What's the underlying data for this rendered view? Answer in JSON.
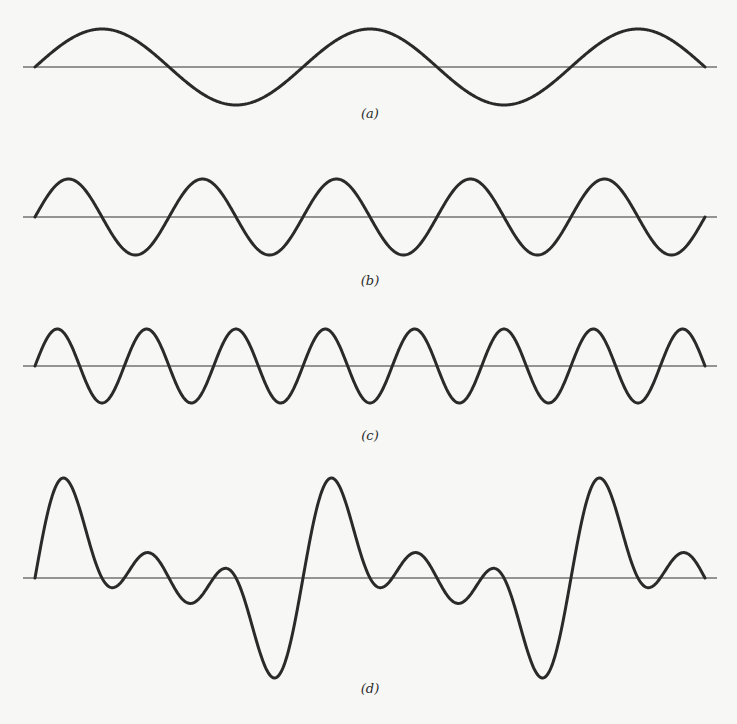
{
  "figure": {
    "panels": [
      {
        "id": "a",
        "label": "(a)",
        "harmonic": 1,
        "amplitude": 1,
        "baseline_y": 67,
        "scale_px": 38,
        "label_y": 118
      },
      {
        "id": "b",
        "label": "(b)",
        "harmonic": 2,
        "amplitude": 1,
        "baseline_y": 217,
        "scale_px": 38,
        "label_y": 285
      },
      {
        "id": "c",
        "label": "(c)",
        "harmonic": 3,
        "amplitude": 1,
        "baseline_y": 366,
        "scale_px": 37,
        "label_y": 440
      },
      {
        "id": "d",
        "label": "(d)",
        "harmonic": "sum",
        "amplitude": 1,
        "baseline_y": 578,
        "scale_px": 40,
        "label_y": 693
      }
    ],
    "x_start": 35,
    "x_end": 705,
    "axis_x_start": 23,
    "axis_x_end": 717,
    "fundamental_cycles": 2.5,
    "colors": {
      "ink": "#2a2a2a",
      "background": "#f7f7f5"
    }
  },
  "chart_data": {
    "type": "line",
    "title": "",
    "series": [
      {
        "name": "(a)",
        "formula": "sin(θ)",
        "cycles": 2.5
      },
      {
        "name": "(b)",
        "formula": "sin(2θ)",
        "cycles": 5
      },
      {
        "name": "(c)",
        "formula": "sin(3θ)",
        "cycles": 7.5
      },
      {
        "name": "(d)",
        "formula": "sin(θ)+sin(2θ)+sin(3θ)",
        "cycles": 2.5
      }
    ],
    "x_range": [
      0,
      "5π"
    ],
    "xlabel": "",
    "ylabel": "",
    "grid": false
  }
}
